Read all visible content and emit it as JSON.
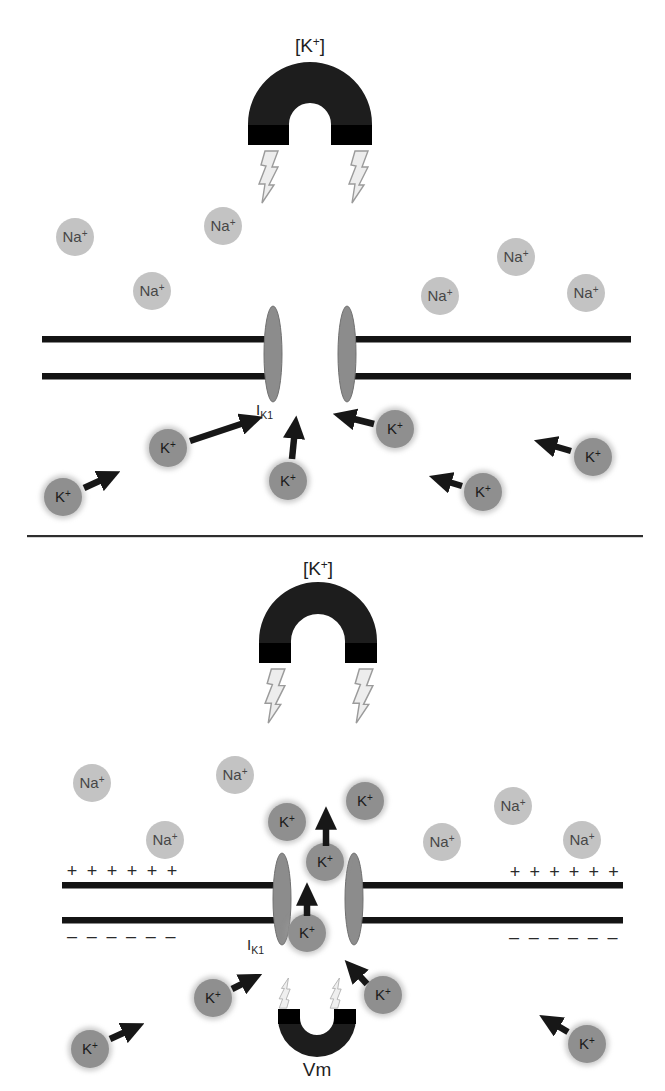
{
  "figure": {
    "width": 665,
    "height": 1091,
    "background": "#ffffff"
  },
  "colors": {
    "na_fill": "#c3c3c3",
    "na_text": "#474747",
    "k_fill": "#8f8f8f",
    "k_halo": "#9a9a9a",
    "k_text": "#1b1b1b",
    "channel_fill": "#8c8c8c",
    "channel_stroke": "#707070",
    "membrane": "#141414",
    "magnet_body": "#1d1d1d",
    "magnet_cap": "#000000",
    "bolt_fill": "#ededed",
    "bolt_stroke": "#9b9b9b",
    "arrow": "#171717",
    "label_text": "#1f1f1f",
    "charge_text": "#2a2a2a",
    "separator": "#2e2e2e"
  },
  "labels": {
    "concentration": {
      "pre": "[K",
      "sup": "+",
      "post": "]"
    },
    "na_ion": {
      "base": "Na",
      "sup": "+"
    },
    "k_ion": {
      "base": "K",
      "sup": "+"
    },
    "channel_current": {
      "main": "I",
      "sub": "K1"
    },
    "membrane_potential": "Vm",
    "plus": "+",
    "minus": "–"
  },
  "separator": {
    "x1": 27,
    "x2": 643,
    "y": 535
  },
  "panels": [
    {
      "id": "panel-resting",
      "magnet": {
        "cx": 310,
        "cy": 124,
        "r_outer": 62,
        "r_inner": 21,
        "pole_y": 145,
        "cap_y": 125,
        "dir": "down",
        "label_x": 310,
        "label_y": 52
      },
      "bolts": [
        {
          "x": 256,
          "y": 151,
          "scale": 1.0,
          "dir": "down"
        },
        {
          "x": 346,
          "y": 151,
          "scale": 1.0,
          "dir": "down"
        }
      ],
      "membrane": {
        "y_top": 336,
        "y_bottom": 373,
        "thickness": 6.5,
        "segments": [
          {
            "x1": 42,
            "x2": 266
          },
          {
            "x1": 354,
            "x2": 631
          }
        ]
      },
      "channels": [
        {
          "cx": 273,
          "cy": 354,
          "rx": 9,
          "ry": 48
        },
        {
          "cx": 347,
          "cy": 354,
          "rx": 9,
          "ry": 48
        }
      ],
      "channel_label": {
        "x": 256,
        "y": 415
      },
      "na_ions": [
        {
          "x": 75,
          "y": 237
        },
        {
          "x": 223,
          "y": 226
        },
        {
          "x": 152,
          "y": 291
        },
        {
          "x": 440,
          "y": 296
        },
        {
          "x": 516,
          "y": 257
        },
        {
          "x": 586,
          "y": 293
        }
      ],
      "k_ions": [
        {
          "x": 63,
          "y": 497,
          "arrow": {
            "x1": 84,
            "y1": 488,
            "x2": 108,
            "y2": 477
          }
        },
        {
          "x": 168,
          "y": 448,
          "arrow": {
            "x1": 190,
            "y1": 441,
            "x2": 250,
            "y2": 421
          }
        },
        {
          "x": 288,
          "y": 481,
          "arrow": {
            "x1": 292,
            "y1": 459,
            "x2": 295,
            "y2": 429
          }
        },
        {
          "x": 395,
          "y": 429,
          "arrow": {
            "x1": 374,
            "y1": 424,
            "x2": 346,
            "y2": 417
          }
        },
        {
          "x": 483,
          "y": 492,
          "arrow": {
            "x1": 462,
            "y1": 486,
            "x2": 442,
            "y2": 480
          }
        },
        {
          "x": 593,
          "y": 457,
          "arrow": {
            "x1": 571,
            "y1": 451,
            "x2": 547,
            "y2": 444
          }
        }
      ],
      "plus_rows": [],
      "minus_rows": []
    },
    {
      "id": "panel-depolarized",
      "magnet": {
        "cx": 318,
        "cy": 641,
        "r_outer": 59,
        "r_inner": 27,
        "pole_y": 663,
        "cap_y": 643,
        "dir": "down",
        "label_x": 318,
        "label_y": 575
      },
      "bolts": [
        {
          "x": 262,
          "y": 669,
          "scale": 1.04,
          "dir": "down"
        },
        {
          "x": 350,
          "y": 669,
          "scale": 1.04,
          "dir": "down"
        }
      ],
      "membrane": {
        "y_top": 882,
        "y_bottom": 917,
        "thickness": 6.5,
        "segments": [
          {
            "x1": 62,
            "x2": 274
          },
          {
            "x1": 360,
            "x2": 623
          }
        ]
      },
      "channels": [
        {
          "cx": 282,
          "cy": 899,
          "rx": 9,
          "ry": 46
        },
        {
          "cx": 354,
          "cy": 899,
          "rx": 9,
          "ry": 46
        }
      ],
      "channel_label": {
        "x": 247,
        "y": 950
      },
      "na_ions": [
        {
          "x": 92,
          "y": 783
        },
        {
          "x": 235,
          "y": 775
        },
        {
          "x": 165,
          "y": 840
        },
        {
          "x": 442,
          "y": 842
        },
        {
          "x": 513,
          "y": 806
        },
        {
          "x": 582,
          "y": 840
        }
      ],
      "k_ions": [
        {
          "x": 287,
          "y": 822
        },
        {
          "x": 365,
          "y": 801
        },
        {
          "x": 325,
          "y": 862,
          "arrow": {
            "x1": 326,
            "y1": 846,
            "x2": 326,
            "y2": 820
          }
        },
        {
          "x": 307,
          "y": 933,
          "arrow": {
            "x1": 307,
            "y1": 916,
            "x2": 307,
            "y2": 896
          }
        },
        {
          "x": 213,
          "y": 998,
          "arrow": {
            "x1": 232,
            "y1": 989,
            "x2": 250,
            "y2": 980
          }
        },
        {
          "x": 383,
          "y": 995,
          "arrow": {
            "x1": 367,
            "y1": 984,
            "x2": 354,
            "y2": 970
          }
        },
        {
          "x": 90,
          "y": 1049,
          "arrow": {
            "x1": 110,
            "y1": 1039,
            "x2": 132,
            "y2": 1029
          }
        },
        {
          "x": 587,
          "y": 1044,
          "arrow": {
            "x1": 568,
            "y1": 1032,
            "x2": 551,
            "y2": 1022
          }
        }
      ],
      "plus_rows": [
        {
          "x0": 72,
          "step": 20,
          "count": 6,
          "y": 877
        },
        {
          "x0": 515,
          "step": 19.7,
          "count": 6,
          "y": 878
        }
      ],
      "minus_rows": [
        {
          "x0": 72,
          "step": 19.7,
          "count": 6,
          "y": 942
        },
        {
          "x0": 514,
          "step": 19.7,
          "count": 6,
          "y": 943
        }
      ],
      "vm_magnet": {
        "cx": 317,
        "cy": 1018,
        "r_outer": 39,
        "r_inner": 17,
        "pole_y": 1009,
        "cap_y": 1024,
        "dir": "up",
        "label_x": 317,
        "label_y": 1076
      },
      "vm_bolts": [
        {
          "x": 278,
          "y": 978,
          "scale": 0.58,
          "dir": "up"
        },
        {
          "x": 329,
          "y": 978,
          "scale": 0.58,
          "dir": "up"
        }
      ]
    }
  ]
}
